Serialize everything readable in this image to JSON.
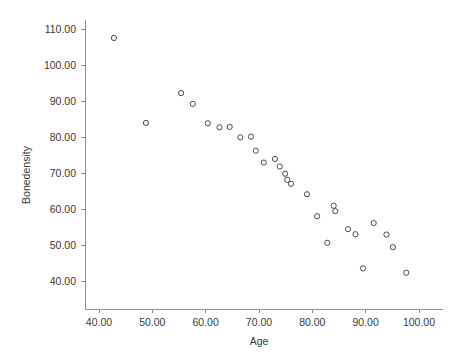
{
  "chart_data": {
    "type": "scatter",
    "title": "",
    "xlabel": "Age",
    "ylabel": "Bonedensity",
    "xlim": [
      37.0,
      103.5
    ],
    "ylim": [
      36.5,
      113.5
    ],
    "grid": false,
    "legend": null,
    "marker": "open-circle",
    "marker_color": "#4a4a52",
    "axis_color": "#8f8f8f",
    "xticks": [
      40,
      50,
      60,
      70,
      80,
      90,
      100
    ],
    "xtick_labels": [
      "40.00",
      "50.00",
      "60.00",
      "70.00",
      "80.00",
      "90.00",
      "100.00"
    ],
    "yticks": [
      40,
      50,
      60,
      70,
      80,
      90,
      100,
      110
    ],
    "ytick_labels": [
      "40.00",
      "50.00",
      "60.00",
      "70.00",
      "80.00",
      "90.00",
      "100.00",
      "110.00"
    ],
    "x": [
      42.8,
      48.8,
      55.4,
      57.6,
      60.4,
      62.6,
      64.5,
      66.5,
      68.5,
      69.4,
      70.9,
      73.0,
      73.9,
      74.9,
      75.3,
      76.0,
      79.0,
      80.9,
      82.8,
      84.0,
      84.3,
      86.7,
      88.1,
      89.5,
      91.5,
      93.9,
      95.1,
      97.6
    ],
    "y": [
      107.5,
      83.9,
      92.2,
      89.2,
      83.8,
      82.7,
      82.8,
      79.9,
      80.1,
      76.2,
      72.9,
      73.9,
      71.8,
      69.8,
      68.1,
      67.0,
      64.1,
      58.0,
      50.6,
      60.9,
      59.4,
      54.4,
      53.0,
      43.5,
      56.1,
      52.9,
      49.4,
      42.3
    ],
    "points": [
      {
        "x": 42.8,
        "y": 107.5
      },
      {
        "x": 48.8,
        "y": 83.9
      },
      {
        "x": 55.4,
        "y": 92.2
      },
      {
        "x": 57.6,
        "y": 89.2
      },
      {
        "x": 60.4,
        "y": 83.8
      },
      {
        "x": 62.6,
        "y": 82.7
      },
      {
        "x": 64.5,
        "y": 82.8
      },
      {
        "x": 66.5,
        "y": 79.9
      },
      {
        "x": 68.5,
        "y": 80.1
      },
      {
        "x": 69.4,
        "y": 76.2
      },
      {
        "x": 70.9,
        "y": 72.9
      },
      {
        "x": 73.0,
        "y": 73.9
      },
      {
        "x": 73.9,
        "y": 71.8
      },
      {
        "x": 74.9,
        "y": 69.8
      },
      {
        "x": 75.3,
        "y": 68.1
      },
      {
        "x": 76.0,
        "y": 67.0
      },
      {
        "x": 79.0,
        "y": 64.1
      },
      {
        "x": 80.9,
        "y": 58.0
      },
      {
        "x": 82.8,
        "y": 50.6
      },
      {
        "x": 84.0,
        "y": 60.9
      },
      {
        "x": 84.3,
        "y": 59.4
      },
      {
        "x": 86.7,
        "y": 54.4
      },
      {
        "x": 88.1,
        "y": 53.0
      },
      {
        "x": 89.5,
        "y": 43.5
      },
      {
        "x": 91.5,
        "y": 56.1
      },
      {
        "x": 93.9,
        "y": 52.9
      },
      {
        "x": 95.1,
        "y": 49.4
      },
      {
        "x": 97.6,
        "y": 42.3
      }
    ]
  }
}
